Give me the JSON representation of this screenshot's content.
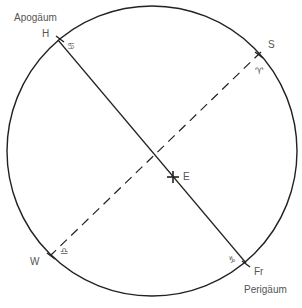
{
  "diagram": {
    "title_labels": {
      "apogee": "Apogäum",
      "perigee": "Perigäum"
    },
    "points": {
      "H": "H",
      "S": "S",
      "W": "W",
      "Fr": "Fr",
      "E": "E"
    },
    "zodiac_symbols": {
      "cancer": "♋",
      "aries": "♈",
      "libra": "♎",
      "capricorn": "♑"
    },
    "colors": {
      "stroke": "#222222",
      "text": "#555555",
      "background": "#ffffff"
    }
  }
}
